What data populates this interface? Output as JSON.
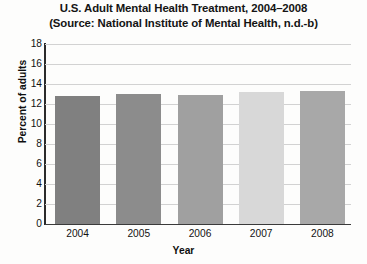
{
  "chart_data": {
    "type": "bar",
    "title": "U.S. Adult Mental Health Treatment, 2004–2008 (Source: National Institute of Mental Health, n.d.-b)",
    "title_lines": [
      "U.S. Adult Mental Health Treatment, 2004–2008",
      "(Source: National Institute of Mental Health, n.d.-b)"
    ],
    "categories": [
      "2004",
      "2005",
      "2006",
      "2007",
      "2008"
    ],
    "values": [
      12.8,
      13.0,
      12.9,
      13.2,
      13.3
    ],
    "xlabel": "Year",
    "ylabel": "Percent of adults",
    "ylim": [
      0,
      18
    ],
    "ytick_step": 2,
    "yticks": [
      "18",
      "16",
      "14",
      "12",
      "10",
      "8",
      "6",
      "4",
      "2",
      "0"
    ],
    "grid": true,
    "legend": false,
    "bar_colors": [
      "#808080",
      "#8c8c8c",
      "#a0a0a0",
      "#d8d8d8",
      "#a8a8a8"
    ],
    "gridline_color": "#d2d2d2",
    "axis_color": "#2b2b2b",
    "background_color": "#fdfdfc",
    "text_color": "#121212"
  }
}
